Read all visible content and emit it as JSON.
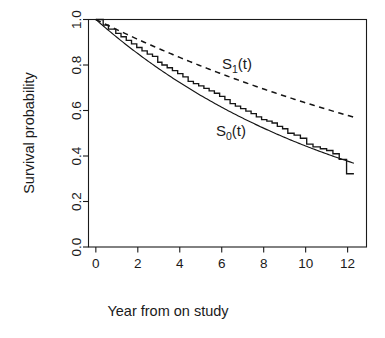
{
  "chart_data": {
    "type": "line",
    "title": "",
    "subtitle": "",
    "xlabel": "Year from on study",
    "ylabel": "Survival probability",
    "xlim": [
      -0.35,
      12.9
    ],
    "ylim": [
      0.0,
      1.0
    ],
    "grid": false,
    "legend_position": "inline-annotations",
    "xticks": [
      0,
      2,
      4,
      6,
      8,
      10,
      12
    ],
    "xticklabels": [
      "0",
      "2",
      "4",
      "6",
      "8",
      "10",
      "12"
    ],
    "yticks": [
      0.0,
      0.2,
      0.4,
      0.6,
      0.8,
      1.0
    ],
    "yticklabels": [
      "0.0",
      "0.2",
      "0.4",
      "0.6",
      "0.8",
      "1.0"
    ],
    "annotations": [
      {
        "name": "S1-label",
        "text": "S",
        "sub": "1",
        "suffix": "(t)",
        "x": 6.15,
        "y": 0.795,
        "style": "dashed-series"
      },
      {
        "name": "S0-label",
        "text": "S",
        "sub": "0",
        "suffix": "(t)",
        "x": 6.05,
        "y": 0.495,
        "style": "solid-series"
      }
    ],
    "series": [
      {
        "name": "S0(t) Kaplan-Meier step estimate",
        "label": "S_0(t)",
        "style": "solid-step",
        "color": "#151515",
        "x": [
          0.0,
          0.35,
          0.6,
          0.95,
          1.2,
          1.45,
          1.7,
          1.95,
          2.2,
          2.45,
          2.7,
          2.95,
          3.15,
          3.4,
          3.65,
          3.9,
          4.15,
          4.4,
          4.65,
          4.9,
          5.15,
          5.4,
          5.65,
          5.9,
          6.15,
          6.4,
          6.65,
          6.9,
          7.15,
          7.4,
          7.65,
          7.9,
          8.15,
          8.4,
          8.65,
          8.9,
          9.15,
          9.45,
          9.75,
          10.05,
          10.35,
          10.7,
          11.0,
          11.3,
          11.6,
          11.95,
          12.3
        ],
        "y": [
          1.0,
          0.975,
          0.958,
          0.939,
          0.924,
          0.908,
          0.893,
          0.877,
          0.862,
          0.848,
          0.838,
          0.812,
          0.8,
          0.788,
          0.775,
          0.762,
          0.748,
          0.728,
          0.718,
          0.708,
          0.697,
          0.686,
          0.676,
          0.662,
          0.648,
          0.63,
          0.619,
          0.608,
          0.597,
          0.586,
          0.572,
          0.56,
          0.553,
          0.545,
          0.53,
          0.52,
          0.5,
          0.492,
          0.478,
          0.452,
          0.44,
          0.432,
          0.424,
          0.41,
          0.385,
          0.322,
          0.322
        ]
      },
      {
        "name": "S0(t) fitted smooth curve",
        "label": "S_0(t) fit",
        "style": "solid-smooth",
        "color": "#151515",
        "model": "exponential",
        "rate_per_year": 0.0812,
        "x": [
          0.0,
          1.0,
          2.0,
          3.0,
          4.0,
          5.0,
          6.0,
          7.0,
          8.0,
          9.0,
          10.0,
          11.0,
          12.0,
          12.3
        ],
        "y": [
          1.0,
          0.922,
          0.85,
          0.784,
          0.723,
          0.667,
          0.615,
          0.567,
          0.523,
          0.482,
          0.444,
          0.41,
          0.378,
          0.369
        ]
      },
      {
        "name": "S1(t) dashed curve",
        "label": "S_1(t)",
        "style": "dashed",
        "color": "#151515",
        "model": "exponential",
        "rate_per_year": 0.0456,
        "x": [
          0.0,
          1.0,
          2.0,
          3.0,
          4.0,
          5.0,
          6.0,
          7.0,
          8.0,
          9.0,
          10.0,
          11.0,
          12.0,
          12.3
        ],
        "y": [
          1.0,
          0.955,
          0.913,
          0.872,
          0.833,
          0.796,
          0.761,
          0.727,
          0.694,
          0.663,
          0.634,
          0.605,
          0.578,
          0.571
        ]
      }
    ]
  },
  "labels": {
    "y_axis_title": "Survival probability",
    "x_axis_title": "Year from on study",
    "s1_base": "S",
    "s1_sub": "1",
    "s1_suffix": "(t)",
    "s0_base": "S",
    "s0_sub": "0",
    "s0_suffix": "(t)"
  }
}
